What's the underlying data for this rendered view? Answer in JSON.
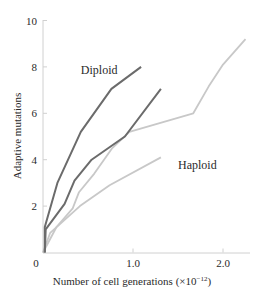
{
  "chart_data": {
    "type": "line",
    "title": "",
    "xlabel": "Number of cell generations (×10⁻¹²)",
    "xlabel_main": "Number of cell generations (",
    "xlabel_times": "×",
    "xlabel_base": "10",
    "xlabel_exp": "−12",
    "xlabel_close": ")",
    "ylabel": "Adaptive mutations",
    "xlim": [
      0,
      2.35
    ],
    "ylim": [
      0,
      10
    ],
    "x_ticks": [
      {
        "value": 0,
        "label": "0"
      },
      {
        "value": 1.0,
        "label": "1.0"
      },
      {
        "value": 2.0,
        "label": "2.0"
      }
    ],
    "y_ticks": [
      {
        "value": 0,
        "label": ""
      },
      {
        "value": 2,
        "label": "2"
      },
      {
        "value": 4,
        "label": "4"
      },
      {
        "value": 6,
        "label": "6"
      },
      {
        "value": 8,
        "label": "8"
      },
      {
        "value": 10,
        "label": "10"
      }
    ],
    "x_zero_label": "0",
    "grid": false,
    "legend": "inline labels",
    "annotations": [
      {
        "text": "Diploid",
        "x": 0.42,
        "y": 7.7
      },
      {
        "text": "Haploid",
        "x": 1.5,
        "y": 3.6
      }
    ],
    "series": [
      {
        "name": "Diploid (replicate 1)",
        "group": "Diploid",
        "color": "#6b6b6b",
        "points": [
          [
            0.02,
            0
          ],
          [
            0.02,
            1.1
          ],
          [
            0.16,
            3.0
          ],
          [
            0.42,
            5.2
          ],
          [
            0.76,
            7.05
          ],
          [
            1.09,
            8.0
          ]
        ]
      },
      {
        "name": "Diploid (replicate 2)",
        "group": "Diploid",
        "color": "#6b6b6b",
        "points": [
          [
            0.02,
            0
          ],
          [
            0.03,
            1.0
          ],
          [
            0.24,
            2.1
          ],
          [
            0.35,
            3.1
          ],
          [
            0.54,
            4.0
          ],
          [
            0.91,
            5.0
          ],
          [
            1.31,
            7.05
          ]
        ]
      },
      {
        "name": "Haploid (replicate 1)",
        "group": "Haploid",
        "color": "#c8c8c8",
        "points": [
          [
            0.0,
            0
          ],
          [
            0.15,
            1.1
          ],
          [
            0.33,
            1.9
          ],
          [
            0.4,
            2.6
          ],
          [
            0.57,
            3.4
          ],
          [
            0.77,
            4.5
          ],
          [
            0.96,
            5.2
          ],
          [
            1.67,
            6.0
          ],
          [
            1.84,
            7.15
          ],
          [
            2.0,
            8.1
          ],
          [
            2.25,
            9.2
          ]
        ]
      },
      {
        "name": "Haploid (replicate 2)",
        "group": "Haploid",
        "color": "#c8c8c8",
        "points": [
          [
            0.0,
            0
          ],
          [
            0.08,
            0.85
          ],
          [
            0.41,
            2.0
          ],
          [
            0.74,
            2.9
          ],
          [
            1.31,
            4.1
          ]
        ]
      }
    ]
  }
}
